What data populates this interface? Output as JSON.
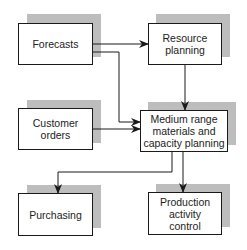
{
  "diagram": {
    "colors": {
      "line": "#1a1a1a",
      "shadow": "#bdbdbd",
      "box_fill": "#ffffff"
    },
    "nodes": [
      {
        "id": "forecasts",
        "label": "Forecasts"
      },
      {
        "id": "resource-planning",
        "label": "Resource\nplanning"
      },
      {
        "id": "customer-orders",
        "label": "Customer\norders"
      },
      {
        "id": "medium-range",
        "label": "Medium range\nmaterials and\ncapacity planning"
      },
      {
        "id": "purchasing",
        "label": "Purchasing"
      },
      {
        "id": "production-activity-control",
        "label": "Production\nactivity\ncontrol"
      }
    ],
    "edges": [
      {
        "from": "forecasts",
        "to": "resource-planning"
      },
      {
        "from": "forecasts",
        "to": "medium-range"
      },
      {
        "from": "customer-orders",
        "to": "medium-range"
      },
      {
        "from": "resource-planning",
        "to": "medium-range"
      },
      {
        "from": "medium-range",
        "to": "purchasing"
      },
      {
        "from": "medium-range",
        "to": "production-activity-control"
      }
    ]
  }
}
